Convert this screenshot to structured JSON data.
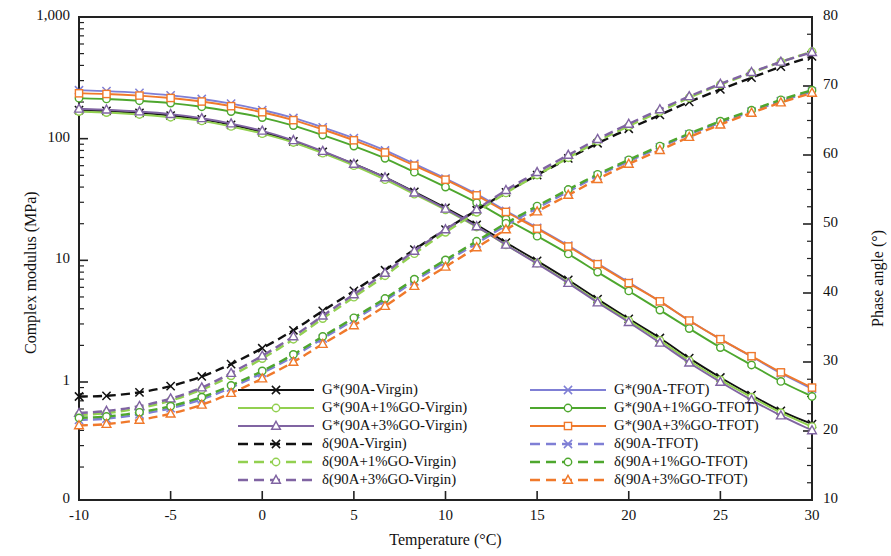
{
  "chart_data": {
    "type": "line",
    "title": "",
    "xlabel": "Temperature  (°C)",
    "ylabel": "Complex modulus (MPa)",
    "y2label": "Phase angle (°)",
    "xlim": [
      -10,
      30
    ],
    "xticks": [
      -10,
      -5,
      0,
      5,
      10,
      15,
      20,
      25,
      30
    ],
    "xtick_labels": [
      "-10",
      "-5",
      "0",
      "5",
      "10",
      "15",
      "20",
      "25",
      "30"
    ],
    "yscale": "log",
    "ylim": [
      0.33,
      1000
    ],
    "yticks": [
      1000,
      100,
      10,
      1
    ],
    "ytick_labels": [
      "1,000",
      "100",
      "10",
      "1",
      "0"
    ],
    "y2lim": [
      10,
      80
    ],
    "y2ticks": [
      10,
      20,
      30,
      40,
      50,
      60,
      70,
      80
    ],
    "y2tick_labels": [
      "10",
      "20",
      "30",
      "40",
      "50",
      "60",
      "70",
      "80"
    ],
    "grid": false,
    "legend_position": "lower-center",
    "x": [
      -10,
      -8.5,
      -6.7,
      -5,
      -3.3,
      -1.7,
      0,
      1.7,
      3.3,
      5,
      6.7,
      8.3,
      10,
      11.7,
      13.3,
      15,
      16.7,
      18.3,
      20,
      21.7,
      23.3,
      25,
      26.7,
      28.3,
      30
    ],
    "series": [
      {
        "name": "G*(90A-Virgin)",
        "axis": "left",
        "color": "#111111",
        "style": "solid",
        "marker": "x",
        "values": [
          172,
          169,
          163,
          155,
          144,
          130,
          113,
          95,
          78,
          62,
          48,
          36.5,
          27,
          19.6,
          14.0,
          9.9,
          6.9,
          4.8,
          3.3,
          2.3,
          1.57,
          1.09,
          0.78,
          0.58,
          0.45
        ]
      },
      {
        "name": "G*(90A+1%GO-Virgin)",
        "axis": "left",
        "color": "#92d050",
        "style": "solid",
        "marker": "circle",
        "values": [
          167,
          164,
          158,
          150,
          140,
          126,
          110,
          93,
          76,
          60,
          46,
          35.0,
          26,
          18.8,
          13.4,
          9.5,
          6.6,
          4.6,
          3.2,
          2.2,
          1.5,
          1.04,
          0.75,
          0.56,
          0.43
        ]
      },
      {
        "name": "G*(90A+3%GO-Virgin)",
        "axis": "left",
        "color": "#8064a2",
        "style": "solid",
        "marker": "triangle",
        "values": [
          176,
          173,
          167,
          159,
          147,
          133,
          116,
          97,
          79,
          62,
          48,
          36.0,
          26.5,
          19.0,
          13.4,
          9.4,
          6.5,
          4.5,
          3.1,
          2.1,
          1.44,
          1.0,
          0.71,
          0.53,
          0.4
        ]
      },
      {
        "name": "G*(90A-TFOT)",
        "axis": "left",
        "color": "#7f7fd5",
        "style": "solid",
        "marker": "x",
        "values": [
          250,
          246,
          238,
          227,
          212,
          194,
          172,
          148,
          124,
          101,
          80,
          62,
          47,
          35.0,
          25.5,
          18.5,
          13.2,
          9.4,
          6.6,
          4.6,
          3.2,
          2.25,
          1.62,
          1.18,
          0.88
        ]
      },
      {
        "name": "G*(90A+1%GO-TFOT)",
        "axis": "left",
        "color": "#4ea72e",
        "style": "solid",
        "marker": "circle",
        "values": [
          215,
          212,
          205,
          196,
          183,
          167,
          149,
          128,
          107,
          87,
          69,
          53,
          40,
          29.8,
          21.8,
          15.8,
          11.3,
          8.0,
          5.6,
          3.9,
          2.75,
          1.92,
          1.38,
          1.01,
          0.76
        ]
      },
      {
        "name": "G*(90A+3%GO-TFOT)",
        "axis": "left",
        "color": "#f0792b",
        "style": "solid",
        "marker": "square",
        "values": [
          236,
          233,
          226,
          216,
          202,
          185,
          165,
          142,
          119,
          97,
          77,
          60,
          46,
          34.2,
          25.0,
          18.2,
          13.0,
          9.3,
          6.5,
          4.6,
          3.2,
          2.25,
          1.63,
          1.2,
          0.9
        ]
      },
      {
        "name": "δ(90A-Virgin)",
        "axis": "right",
        "color": "#111111",
        "style": "dashed",
        "marker": "x",
        "values": [
          25.0,
          25.1,
          25.6,
          26.5,
          27.9,
          29.7,
          32.0,
          34.6,
          37.4,
          40.3,
          43.3,
          46.3,
          49.2,
          52.0,
          54.6,
          57.1,
          59.5,
          61.7,
          63.8,
          65.8,
          67.7,
          69.5,
          71.2,
          72.8,
          74.3
        ]
      },
      {
        "name": "δ(90A+1%GO-Virgin)",
        "axis": "right",
        "color": "#92d050",
        "style": "dashed",
        "marker": "circle",
        "values": [
          22.3,
          22.6,
          23.3,
          24.4,
          26.0,
          28.0,
          30.5,
          33.3,
          36.3,
          39.4,
          42.5,
          45.7,
          48.8,
          51.7,
          54.5,
          57.1,
          59.6,
          62.0,
          64.2,
          66.3,
          68.3,
          70.2,
          71.9,
          73.5,
          75.0
        ]
      },
      {
        "name": "δ(90A+3%GO-Virgin)",
        "axis": "right",
        "color": "#8064a2",
        "style": "dashed",
        "marker": "triangle",
        "values": [
          22.6,
          22.9,
          23.6,
          24.7,
          26.3,
          28.4,
          30.9,
          33.7,
          36.7,
          39.8,
          42.9,
          46.1,
          49.2,
          52.1,
          54.9,
          57.5,
          60.0,
          62.3,
          64.5,
          66.6,
          68.5,
          70.3,
          72.0,
          73.5,
          74.9
        ]
      },
      {
        "name": "δ(90A-TFOT)",
        "axis": "right",
        "color": "#7f7fd5",
        "style": "dashed",
        "marker": "x",
        "values": [
          21.6,
          21.8,
          22.4,
          23.3,
          24.6,
          26.3,
          28.4,
          30.8,
          33.4,
          36.1,
          38.9,
          41.7,
          44.5,
          47.2,
          49.8,
          52.3,
          54.7,
          57.0,
          59.1,
          61.1,
          63.0,
          64.7,
          66.3,
          67.8,
          69.2
        ]
      },
      {
        "name": "δ(90A+1%GO-TFOT)",
        "axis": "right",
        "color": "#4ea72e",
        "style": "dashed",
        "marker": "circle",
        "values": [
          21.9,
          22.1,
          22.7,
          23.6,
          24.9,
          26.6,
          28.7,
          31.1,
          33.7,
          36.4,
          39.2,
          42.0,
          44.8,
          47.5,
          50.1,
          52.6,
          55.0,
          57.2,
          59.3,
          61.3,
          63.1,
          64.9,
          66.5,
          68.0,
          69.4
        ]
      },
      {
        "name": "δ(90A+3%GO-TFOT)",
        "axis": "right",
        "color": "#f0792b",
        "style": "dashed",
        "marker": "triangle",
        "values": [
          20.8,
          21.0,
          21.6,
          22.5,
          23.8,
          25.5,
          27.6,
          30.0,
          32.6,
          35.3,
          38.1,
          41.0,
          43.8,
          46.6,
          49.2,
          51.8,
          54.2,
          56.5,
          58.7,
          60.7,
          62.6,
          64.4,
          66.1,
          67.6,
          69.0
        ]
      }
    ]
  },
  "legend": {
    "column1": [
      "G*(90A-Virgin)",
      "G*(90A+1%GO-Virgin)",
      "G*(90A+3%GO-Virgin)",
      "δ(90A-Virgin)",
      "δ(90A+1%GO-Virgin)",
      "δ(90A+3%GO-Virgin)"
    ],
    "column2": [
      "G*(90A-TFOT)",
      "G*(90A+1%GO-TFOT)",
      "G*(90A+3%GO-TFOT)",
      "δ(90A-TFOT)",
      "δ(90A+1%GO-TFOT)",
      "δ(90A+3%GO-TFOT)"
    ]
  }
}
